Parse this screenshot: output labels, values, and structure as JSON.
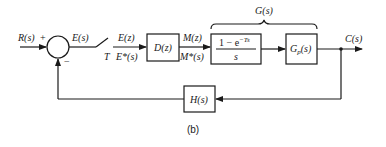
{
  "diagram": {
    "caption": "(b)",
    "input": {
      "label": "R(s)",
      "sign": "+"
    },
    "summing_junction": {
      "feedback_sign": "−"
    },
    "error": {
      "label": "E(s)"
    },
    "sampler": {
      "label": "T"
    },
    "sampled_error": {
      "top": "E(z)",
      "bottom": "E*(s)"
    },
    "controller": {
      "label": "D(z)"
    },
    "controller_output": {
      "top": "M(z)",
      "bottom": "M*(s)"
    },
    "zoh": {
      "numerator": "1 − e",
      "exponent": "−Ts",
      "denominator": "s"
    },
    "plant": {
      "label": "G",
      "subscript": "p",
      "arg": "(s)"
    },
    "group_label": "G(s)",
    "output": {
      "label": "C(s)"
    },
    "feedback": {
      "label": "H(s)"
    }
  },
  "colors": {
    "stroke": "#1a1a1a",
    "background": "#ffffff"
  }
}
